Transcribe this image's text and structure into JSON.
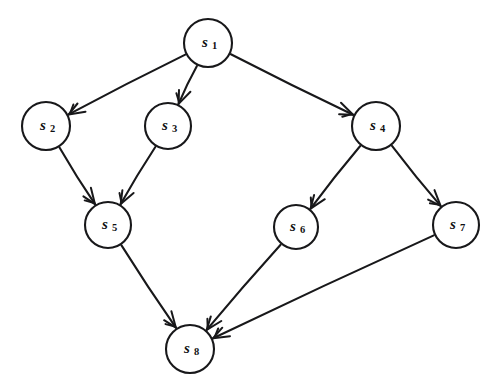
{
  "figure": {
    "type": "directed-graph",
    "title": "",
    "background_color": "#ffffff",
    "stroke_color": "#18181a"
  },
  "nodes": [
    {
      "id": "s1",
      "label_base": "s",
      "label_sub": "1",
      "cx": 208,
      "cy": 43,
      "r": 24
    },
    {
      "id": "s2",
      "label_base": "s",
      "label_sub": "2",
      "cx": 46,
      "cy": 126,
      "r": 24
    },
    {
      "id": "s3",
      "label_base": "s",
      "label_sub": "3",
      "cx": 168,
      "cy": 126,
      "r": 23
    },
    {
      "id": "s4",
      "label_base": "s",
      "label_sub": "4",
      "cx": 376,
      "cy": 126,
      "r": 24
    },
    {
      "id": "s5",
      "label_base": "s",
      "label_sub": "5",
      "cx": 108,
      "cy": 225,
      "r": 23
    },
    {
      "id": "s6",
      "label_base": "s",
      "label_sub": "6",
      "cx": 296,
      "cy": 227,
      "r": 22
    },
    {
      "id": "s7",
      "label_base": "s",
      "label_sub": "7",
      "cx": 456,
      "cy": 225,
      "r": 23
    },
    {
      "id": "s8",
      "label_base": "s",
      "label_sub": "8",
      "cx": 190,
      "cy": 349,
      "r": 24
    }
  ],
  "edges": [
    {
      "id": "e1",
      "from": "s1",
      "to": "s2",
      "directed": true
    },
    {
      "id": "e2",
      "from": "s1",
      "to": "s3",
      "directed": true
    },
    {
      "id": "e3",
      "from": "s1",
      "to": "s4",
      "directed": true
    },
    {
      "id": "e4",
      "from": "s2",
      "to": "s5",
      "directed": true
    },
    {
      "id": "e5",
      "from": "s3",
      "to": "s5",
      "directed": true
    },
    {
      "id": "e6",
      "from": "s4",
      "to": "s6",
      "directed": true
    },
    {
      "id": "e7",
      "from": "s4",
      "to": "s7",
      "directed": true
    },
    {
      "id": "e8",
      "from": "s5",
      "to": "s8",
      "directed": true
    },
    {
      "id": "e9",
      "from": "s6",
      "to": "s8",
      "directed": true
    },
    {
      "id": "e10",
      "from": "s7",
      "to": "s8",
      "directed": true
    }
  ]
}
